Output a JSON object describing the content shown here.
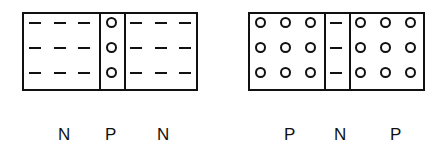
{
  "diagrams": [
    {
      "name": "npn-transistor",
      "regions": [
        "N",
        "P",
        "N"
      ],
      "region_contents": [
        "electrons",
        "holes",
        "electrons"
      ],
      "rows": 3
    },
    {
      "name": "pnp-transistor",
      "regions": [
        "P",
        "N",
        "P"
      ],
      "region_contents": [
        "holes",
        "electrons",
        "holes"
      ],
      "rows": 3
    }
  ],
  "labels": {
    "left": [
      "N",
      "P",
      "N"
    ],
    "right": [
      "P",
      "N",
      "P"
    ]
  },
  "colors": {
    "line": "#111111",
    "background": "#ffffff"
  }
}
